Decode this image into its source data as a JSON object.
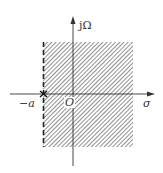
{
  "diagram": {
    "type": "s-plane region of convergence",
    "axes": {
      "vertical_label": "jΩ",
      "horizontal_label": "σ",
      "origin_label": "O"
    },
    "markers": {
      "pole_label": "−a",
      "pole_symbol": "×"
    },
    "region": {
      "description": "shaded region to the right of dashed line at σ = −a",
      "boundary_style": "dashed",
      "fill_pattern": "diagonal hatching"
    },
    "colors": {
      "line": "#333333",
      "hatch": "#555555",
      "background": "#ffffff"
    }
  }
}
